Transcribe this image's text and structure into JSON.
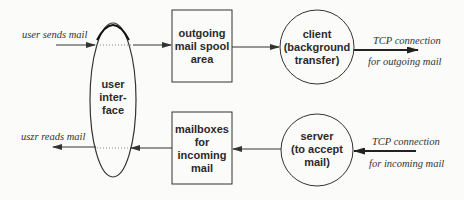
{
  "diagram": {
    "type": "flow",
    "nodes": [
      {
        "id": "ui",
        "shape": "ellipse",
        "lines": [
          "user",
          "inter-",
          "face"
        ]
      },
      {
        "id": "outgoing",
        "shape": "rect",
        "lines": [
          "outgoing",
          "mail spool",
          "area"
        ]
      },
      {
        "id": "mailboxes",
        "shape": "rect",
        "lines": [
          "mailboxes",
          "for",
          "incoming",
          "mail"
        ]
      },
      {
        "id": "client",
        "shape": "circle",
        "lines": [
          "client",
          "(background",
          "transfer)"
        ]
      },
      {
        "id": "server",
        "shape": "circle",
        "lines": [
          "server",
          "(to accept",
          "mail)"
        ]
      }
    ],
    "edges": [
      {
        "from": "external",
        "to": "ui",
        "label": "user sends mail"
      },
      {
        "from": "ui",
        "to": "outgoing"
      },
      {
        "from": "outgoing",
        "to": "client"
      },
      {
        "from": "client",
        "to": "external",
        "label": [
          "TCP connection",
          "for outgoing mail"
        ]
      },
      {
        "from": "external",
        "to": "server",
        "label": [
          "TCP connection",
          "for incoming mail"
        ]
      },
      {
        "from": "server",
        "to": "mailboxes"
      },
      {
        "from": "mailboxes",
        "to": "ui"
      },
      {
        "from": "ui",
        "to": "external",
        "label": "uszr reads mail"
      }
    ]
  },
  "labels": {
    "user_sends": "user sends mail",
    "user_reads": "uszr reads mail",
    "tcp_out_1": "TCP connection",
    "tcp_out_2": "for outgoing mail",
    "tcp_in_1": "TCP connection",
    "tcp_in_2": "for incoming mail",
    "ui": [
      "user",
      "inter-",
      "face"
    ],
    "outgoing": [
      "outgoing",
      "mail spool",
      "area"
    ],
    "mailboxes": [
      "mailboxes",
      "for",
      "incoming",
      "mail"
    ],
    "client": [
      "client",
      "(background",
      "transfer)"
    ],
    "server": [
      "server",
      "(to accept",
      "mail)"
    ]
  },
  "colors": {
    "stroke": "#3a3a3a",
    "background": "#fbfbf9"
  }
}
